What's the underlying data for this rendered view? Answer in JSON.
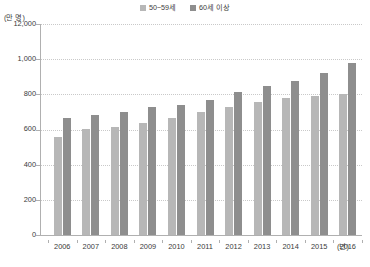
{
  "chart_data": {
    "type": "bar",
    "title": "",
    "subtitle": "",
    "xlabel": "(년)",
    "ylabel": "(만 명)",
    "categories": [
      "2006",
      "2007",
      "2008",
      "2009",
      "2010",
      "2011",
      "2012",
      "2013",
      "2014",
      "2015",
      "2016"
    ],
    "series": [
      {
        "name": "50~59세",
        "color": "#b7b7b7",
        "values": [
          559,
          600,
          612,
          635,
          665,
          700,
          730,
          757,
          779,
          790,
          803
        ]
      },
      {
        "name": "60세 이상",
        "color": "#8e8e8e",
        "values": [
          665,
          685,
          700,
          729,
          741,
          768,
          815,
          845,
          877,
          920,
          979
        ]
      }
    ],
    "ylim": [
      0,
      1200
    ],
    "yticks": [
      0,
      200,
      400,
      600,
      800,
      1000,
      1200
    ],
    "ytick_labels": [
      "0",
      "200",
      "400",
      "600",
      "800",
      "1,000",
      "12,000"
    ],
    "grid": true,
    "grid_axis": "y",
    "legend_position": "top-center"
  },
  "legend": {
    "items": [
      {
        "label": "50~59세",
        "color": "#b7b7b7",
        "icon": "square-swatch-icon"
      },
      {
        "label": "60세 이상",
        "color": "#8e8e8e",
        "icon": "square-swatch-icon"
      }
    ]
  },
  "axes": {
    "y_unit": "(만 명)",
    "x_unit": "(년)",
    "y_tick_labels": [
      "12,000",
      "1,000",
      "800",
      "600",
      "400",
      "200",
      "0"
    ],
    "x_tick_labels": [
      "2006",
      "2007",
      "2008",
      "2009",
      "2010",
      "2011",
      "2012",
      "2013",
      "2014",
      "2015",
      "2016"
    ]
  }
}
